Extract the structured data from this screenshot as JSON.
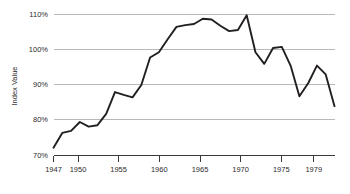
{
  "chart_data": {
    "type": "line",
    "title": "",
    "xlabel": "",
    "ylabel": "Index Value",
    "grid": true,
    "legend": false,
    "xlim": [
      1947,
      1979
    ],
    "ylim": [
      70,
      110
    ],
    "y_tick_labels": [
      "110%",
      "100%",
      "90%",
      "80%",
      "70%"
    ],
    "y_ticks": [
      110,
      100,
      90,
      80,
      70
    ],
    "x_tick_labels": [
      "1947",
      "1950",
      "1955",
      "1960",
      "1965",
      "1970",
      "1975",
      "1979"
    ],
    "x_ticks": [
      1947,
      1950,
      1955,
      1960,
      1965,
      1970,
      1975,
      1979
    ],
    "series": [
      {
        "name": "Index Value",
        "color": "#231f20",
        "x": [
          1947,
          1948,
          1949,
          1950,
          1951,
          1952,
          1953,
          1954,
          1955,
          1956,
          1957,
          1958,
          1959,
          1960,
          1961,
          1962,
          1963,
          1964,
          1965,
          1966,
          1967,
          1968,
          1969,
          1970,
          1971,
          1972,
          1973,
          1974,
          1975,
          1976,
          1977,
          1978,
          1979
        ],
        "values": [
          72.2,
          76.4,
          77.0,
          79.5,
          78.2,
          78.6,
          81.8,
          88.0,
          87.2,
          86.5,
          90.0,
          97.8,
          99.3,
          103.0,
          106.5,
          107.0,
          107.3,
          108.8,
          108.6,
          106.8,
          105.3,
          105.6,
          109.8,
          99.3,
          96.0,
          100.5,
          100.8,
          95.5,
          86.8,
          90.5,
          95.5,
          93.0,
          84.0
        ]
      }
    ]
  },
  "axis": {
    "y_title": "Index Value"
  }
}
